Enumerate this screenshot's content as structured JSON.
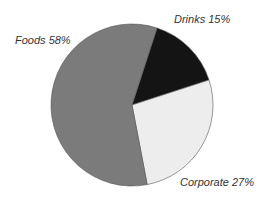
{
  "chart_data": {
    "type": "pie",
    "title": "",
    "categories": [
      "Foods",
      "Drinks",
      "Corporate"
    ],
    "values": [
      58,
      15,
      27
    ],
    "unit": "%",
    "colors": [
      "#7b7b7b",
      "#141414",
      "#ededed"
    ],
    "labels": [
      "Foods 58%",
      "Drinks 15%",
      "Corporate 27%"
    ],
    "legend": "none (direct labels)"
  }
}
